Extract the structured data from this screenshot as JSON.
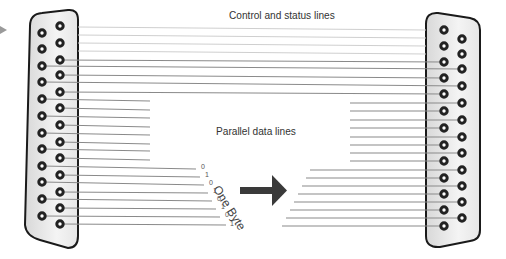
{
  "labels": {
    "control_status": "Control and status lines",
    "parallel_data": "Parallel data lines",
    "one_byte": "One Byte"
  },
  "bits": [
    "0",
    "1",
    "0",
    "1",
    "0",
    "1",
    "0",
    "1"
  ],
  "connectors": {
    "left": {
      "type": "DB-25",
      "pins": 25,
      "rows": [
        12,
        13
      ]
    },
    "right": {
      "type": "DB-25",
      "pins": 25,
      "rows": [
        13,
        12
      ]
    }
  },
  "colors": {
    "line": "#8a8a8a",
    "faint_line": "#c8c8c8",
    "connector_stroke": "#1a1a1a",
    "pin": "#222222",
    "arrow": "#3a3a3a"
  },
  "icons": {
    "pointer": "triangle-right-icon",
    "direction": "arrow-right-icon"
  }
}
